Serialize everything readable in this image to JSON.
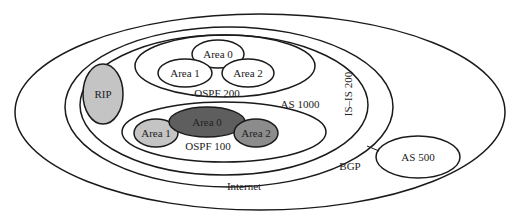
{
  "diagram": {
    "type": "nested-routing-domains",
    "colors": {
      "stroke": "#1a1a1a",
      "background": "#ffffff",
      "light_gray": "#c4c4c4",
      "mid_gray": "#8c8c8c",
      "dark_gray": "#5e5e5e"
    },
    "regions": {
      "internet": {
        "label": "Internet"
      },
      "isis": {
        "label": "IS–IS 200"
      },
      "as1000": {
        "label": "AS 1000"
      },
      "ospf200": {
        "label": "OSPF 200",
        "areas": [
          {
            "label": "Area 0"
          },
          {
            "label": "Area 1"
          },
          {
            "label": "Area 2"
          }
        ]
      },
      "ospf100": {
        "label": "OSPF 100",
        "areas": [
          {
            "label": "Area 0"
          },
          {
            "label": "Area 1"
          },
          {
            "label": "Area 2"
          }
        ]
      },
      "rip": {
        "label": "RIP"
      },
      "as500": {
        "label": "AS 500"
      }
    },
    "links": [
      {
        "label": "BGP",
        "from": "IS–IS 200",
        "to": "AS 500"
      }
    ]
  }
}
